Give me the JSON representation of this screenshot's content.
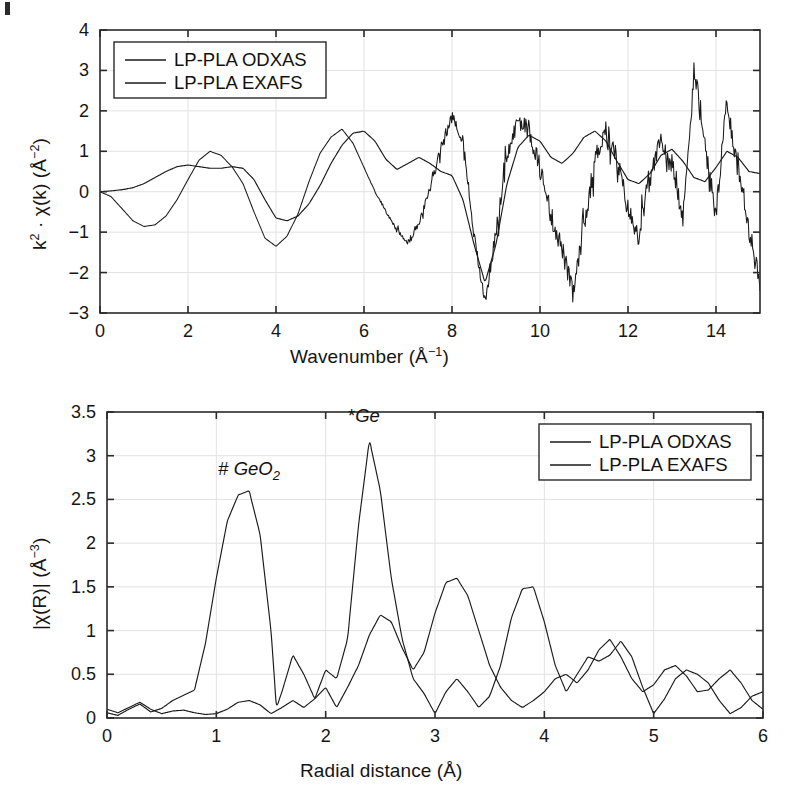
{
  "figure": {
    "background": "#ffffff",
    "line_color": "#1a1a1a",
    "grid_color": "#e2e2e2",
    "axis_color": "#2a2a2a"
  },
  "panels": [
    {
      "id": "top",
      "ylabel": "k2 · χ(k)  (Å-2)",
      "xlabel": "Wavenumber (Å-1)",
      "legend": [
        {
          "label": "LP-PLA ODXAS"
        },
        {
          "label": "LP-PLA EXAFS"
        }
      ]
    },
    {
      "id": "bottom",
      "ylabel": "|χ(R)|  (Å-3)",
      "xlabel": "Radial distance (Å)",
      "legend": [
        {
          "label": "LP-PLA ODXAS"
        },
        {
          "label": "LP-PLA EXAFS"
        }
      ],
      "annotations": [
        {
          "prefix": "#",
          "text": "GeO",
          "sub": "2"
        },
        {
          "prefix": "*",
          "text": "Ge",
          "sub": ""
        }
      ]
    }
  ],
  "chart_data": [
    {
      "type": "line",
      "id": "k2-chi-k",
      "title": "",
      "xlabel": "Wavenumber (Å⁻¹)",
      "ylabel": "k² · χ(k) (Å⁻²)",
      "xlim": [
        0,
        15
      ],
      "ylim": [
        -3,
        4
      ],
      "xticks": [
        0,
        2,
        4,
        6,
        8,
        10,
        12,
        14
      ],
      "yticks": [
        -3,
        -2,
        -1,
        0,
        1,
        2,
        3,
        4
      ],
      "grid": true,
      "legend_position": "top-left",
      "series": [
        {
          "name": "LP-PLA ODXAS",
          "noise": 0.26,
          "noise_onset": 6.0,
          "x": [
            0.0,
            0.25,
            0.5,
            0.75,
            1.0,
            1.25,
            1.5,
            1.75,
            2.0,
            2.25,
            2.5,
            2.75,
            3.0,
            3.25,
            3.5,
            3.75,
            4.0,
            4.25,
            4.5,
            4.75,
            5.0,
            5.25,
            5.5,
            5.75,
            6.0,
            6.25,
            6.5,
            6.75,
            7.0,
            7.25,
            7.5,
            7.75,
            8.0,
            8.25,
            8.5,
            8.75,
            9.0,
            9.25,
            9.5,
            9.75,
            10.0,
            10.25,
            10.5,
            10.75,
            11.0,
            11.25,
            11.5,
            11.75,
            12.0,
            12.25,
            12.5,
            12.75,
            13.0,
            13.25,
            13.5,
            13.75,
            14.0,
            14.25,
            14.5,
            14.75,
            15.0
          ],
          "y": [
            0.0,
            -0.12,
            -0.42,
            -0.72,
            -0.86,
            -0.82,
            -0.6,
            -0.2,
            0.3,
            0.78,
            1.0,
            0.9,
            0.62,
            0.2,
            -0.5,
            -1.15,
            -1.35,
            -1.1,
            -0.55,
            0.25,
            0.95,
            1.35,
            1.55,
            1.2,
            0.6,
            0.0,
            -0.5,
            -0.95,
            -1.25,
            -0.8,
            0.1,
            1.1,
            1.85,
            1.3,
            -1.1,
            -2.72,
            -1.0,
            0.85,
            1.8,
            1.5,
            0.6,
            -0.6,
            -1.4,
            -2.55,
            -0.9,
            0.8,
            1.6,
            0.8,
            -0.45,
            -1.05,
            0.3,
            1.3,
            0.6,
            -0.7,
            3.05,
            1.1,
            -0.6,
            2.25,
            0.5,
            -0.9,
            -2.35
          ]
        },
        {
          "name": "LP-PLA EXAFS",
          "noise": 0.0,
          "x": [
            0.0,
            0.25,
            0.5,
            0.75,
            1.0,
            1.25,
            1.5,
            1.75,
            2.0,
            2.25,
            2.5,
            2.75,
            3.0,
            3.25,
            3.5,
            3.75,
            4.0,
            4.25,
            4.5,
            4.75,
            5.0,
            5.25,
            5.5,
            5.75,
            6.0,
            6.25,
            6.5,
            6.75,
            7.0,
            7.25,
            7.5,
            7.75,
            8.0,
            8.25,
            8.5,
            8.75,
            9.0,
            9.25,
            9.5,
            9.75,
            10.0,
            10.25,
            10.5,
            10.75,
            11.0,
            11.25,
            11.5,
            11.75,
            12.0,
            12.25,
            12.5,
            12.75,
            13.0,
            13.25,
            13.5,
            13.75,
            14.0,
            14.25,
            14.5,
            14.75,
            15.0
          ],
          "y": [
            0.0,
            0.02,
            0.05,
            0.1,
            0.2,
            0.35,
            0.5,
            0.62,
            0.66,
            0.62,
            0.58,
            0.58,
            0.62,
            0.58,
            0.3,
            -0.2,
            -0.65,
            -0.72,
            -0.6,
            -0.3,
            0.15,
            0.7,
            1.15,
            1.45,
            1.5,
            1.25,
            0.8,
            0.55,
            0.7,
            0.85,
            0.7,
            0.5,
            0.4,
            -0.2,
            -1.3,
            -2.25,
            -1.3,
            0.2,
            1.1,
            1.4,
            1.25,
            0.85,
            0.7,
            0.95,
            1.35,
            1.5,
            1.25,
            0.75,
            0.3,
            0.2,
            0.45,
            0.9,
            1.05,
            0.75,
            0.35,
            0.25,
            0.6,
            1.0,
            0.85,
            0.5,
            0.45
          ]
        }
      ]
    },
    {
      "type": "line",
      "id": "chi-R",
      "title": "",
      "xlabel": "Radial distance (Å)",
      "ylabel": "|χ(R)| (Å⁻³)",
      "xlim": [
        0,
        6
      ],
      "ylim": [
        0,
        3.5
      ],
      "xticks": [
        0,
        1,
        2,
        3,
        4,
        5,
        6
      ],
      "yticks": [
        0,
        0.5,
        1,
        1.5,
        2,
        2.5,
        3,
        3.5
      ],
      "grid": true,
      "legend_position": "top-right",
      "annotations": [
        {
          "label": "# GeO2",
          "x": 1.3,
          "y": 2.6,
          "peak_value": 2.6
        },
        {
          "label": "*Ge",
          "x": 2.35,
          "y": 3.2,
          "peak_value": 3.2
        }
      ],
      "series": [
        {
          "name": "LP-PLA ODXAS",
          "x": [
            0.0,
            0.1,
            0.2,
            0.3,
            0.4,
            0.5,
            0.6,
            0.7,
            0.8,
            0.9,
            1.0,
            1.1,
            1.2,
            1.3,
            1.4,
            1.5,
            1.55,
            1.6,
            1.7,
            1.8,
            1.9,
            2.0,
            2.1,
            2.2,
            2.3,
            2.4,
            2.5,
            2.6,
            2.7,
            2.8,
            2.9,
            3.0,
            3.1,
            3.2,
            3.3,
            3.4,
            3.5,
            3.6,
            3.7,
            3.8,
            3.9,
            4.0,
            4.1,
            4.2,
            4.3,
            4.4,
            4.5,
            4.6,
            4.7,
            4.8,
            4.9,
            5.0,
            5.1,
            5.2,
            5.3,
            5.4,
            5.5,
            5.6,
            5.7,
            5.8,
            5.9,
            6.0
          ],
          "y": [
            0.06,
            0.03,
            0.1,
            0.16,
            0.07,
            0.11,
            0.2,
            0.26,
            0.32,
            0.85,
            1.6,
            2.25,
            2.55,
            2.6,
            2.1,
            1.0,
            0.12,
            0.3,
            0.72,
            0.5,
            0.22,
            0.55,
            0.45,
            0.9,
            2.2,
            3.18,
            2.6,
            1.6,
            0.9,
            0.45,
            0.28,
            0.05,
            0.3,
            0.45,
            0.3,
            0.12,
            0.25,
            0.6,
            1.15,
            1.48,
            1.5,
            1.1,
            0.6,
            0.3,
            0.5,
            0.7,
            0.65,
            0.72,
            0.88,
            0.7,
            0.35,
            0.05,
            0.22,
            0.45,
            0.55,
            0.5,
            0.4,
            0.2,
            0.05,
            0.12,
            0.25,
            0.3
          ]
        },
        {
          "name": "LP-PLA EXAFS",
          "x": [
            0.0,
            0.1,
            0.2,
            0.3,
            0.4,
            0.5,
            0.6,
            0.7,
            0.8,
            0.9,
            1.0,
            1.1,
            1.2,
            1.3,
            1.4,
            1.5,
            1.6,
            1.7,
            1.8,
            1.9,
            2.0,
            2.1,
            2.2,
            2.3,
            2.4,
            2.5,
            2.6,
            2.7,
            2.8,
            2.9,
            3.0,
            3.1,
            3.2,
            3.3,
            3.4,
            3.5,
            3.6,
            3.7,
            3.8,
            3.9,
            4.0,
            4.1,
            4.2,
            4.3,
            4.4,
            4.5,
            4.6,
            4.7,
            4.8,
            4.9,
            5.0,
            5.1,
            5.2,
            5.3,
            5.4,
            5.5,
            5.6,
            5.7,
            5.8,
            5.9,
            6.0
          ],
          "y": [
            0.1,
            0.06,
            0.12,
            0.18,
            0.1,
            0.05,
            0.08,
            0.09,
            0.06,
            0.04,
            0.05,
            0.1,
            0.18,
            0.2,
            0.15,
            0.05,
            0.12,
            0.2,
            0.12,
            0.22,
            0.35,
            0.12,
            0.35,
            0.6,
            0.95,
            1.18,
            1.1,
            0.8,
            0.55,
            0.75,
            1.2,
            1.55,
            1.6,
            1.4,
            1.0,
            0.6,
            0.35,
            0.2,
            0.12,
            0.2,
            0.3,
            0.45,
            0.5,
            0.4,
            0.55,
            0.78,
            0.9,
            0.7,
            0.45,
            0.3,
            0.38,
            0.55,
            0.6,
            0.48,
            0.3,
            0.32,
            0.45,
            0.55,
            0.4,
            0.2,
            0.1
          ]
        }
      ]
    }
  ]
}
